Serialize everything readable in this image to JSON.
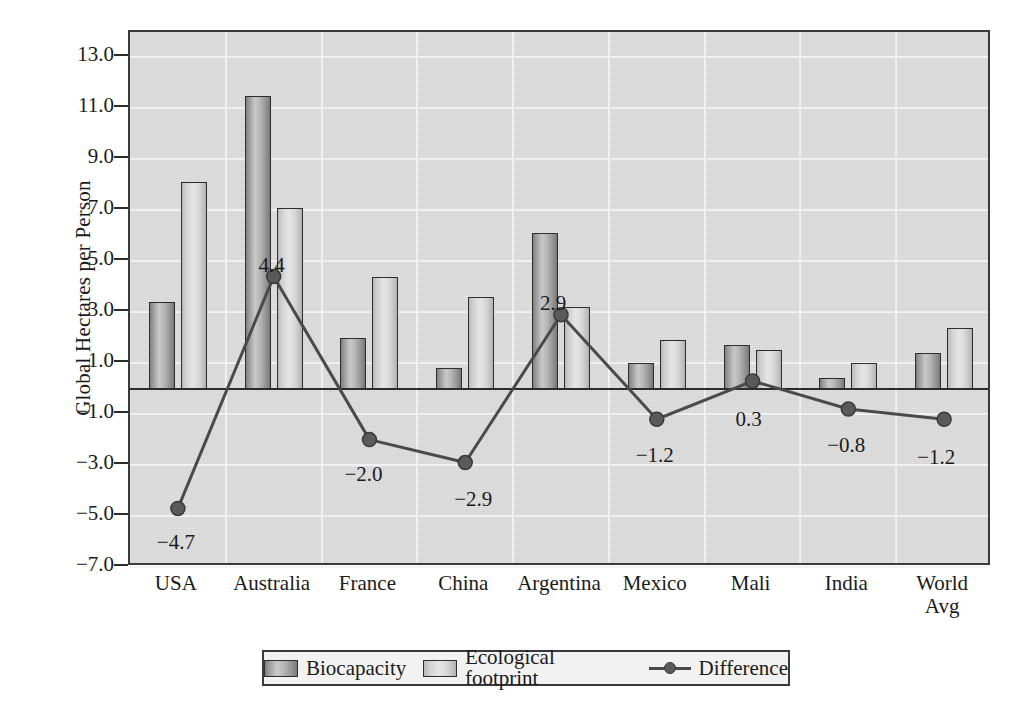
{
  "chart_data": {
    "type": "bar",
    "title": "",
    "xlabel": "",
    "ylabel": "Global Hectares per Person",
    "categories": [
      "USA",
      "Australia",
      "France",
      "China",
      "Argentina",
      "Mexico",
      "Mali",
      "India",
      "World\nAvg"
    ],
    "ylim": [
      -7.0,
      14.0
    ],
    "yticks": [
      "13.0",
      "11.0",
      "9.0",
      "7.0",
      "5.0",
      "3.0",
      "1.0",
      "−1.0",
      "−3.0",
      "−5.0",
      "−7.0"
    ],
    "ytick_values": [
      13.0,
      11.0,
      9.0,
      7.0,
      5.0,
      3.0,
      1.0,
      -1.0,
      -3.0,
      -5.0,
      -7.0
    ],
    "grid": true,
    "legend_position": "bottom",
    "series": [
      {
        "name": "Biocapacity",
        "kind": "bar",
        "color": "#9a9a9a",
        "values": [
          3.4,
          11.5,
          2.0,
          0.8,
          6.1,
          1.0,
          1.7,
          0.4,
          1.4
        ]
      },
      {
        "name": "Ecological footprint",
        "kind": "bar",
        "color": "#dcdcdc",
        "values": [
          8.1,
          7.1,
          4.4,
          3.6,
          3.2,
          1.9,
          1.5,
          1.0,
          2.4
        ]
      },
      {
        "name": "Difference",
        "kind": "line",
        "color": "#4a4a4a",
        "values": [
          -4.7,
          4.4,
          -2.0,
          -2.9,
          2.9,
          -1.2,
          0.3,
          -0.8,
          -1.2
        ],
        "labels": [
          "−4.7",
          "4.4",
          "−2.0",
          "−2.9",
          "2.9",
          "−1.2",
          "0.3",
          "−0.8",
          "−1.2"
        ]
      }
    ]
  },
  "legend": {
    "items": [
      {
        "label": "Biocapacity",
        "marker": "bio-swatch"
      },
      {
        "label": "Ecological footprint",
        "marker": "foot-swatch"
      },
      {
        "label": "Difference",
        "marker": "line-marker"
      }
    ]
  },
  "colors": {
    "plot_background": "#dcdcdc",
    "grid": "#f4f4f4",
    "axis": "#2b2b2b",
    "bar_biocapacity": "#9a9a9a",
    "bar_footprint": "#dcdcdc",
    "line_difference": "#4a4a4a"
  }
}
